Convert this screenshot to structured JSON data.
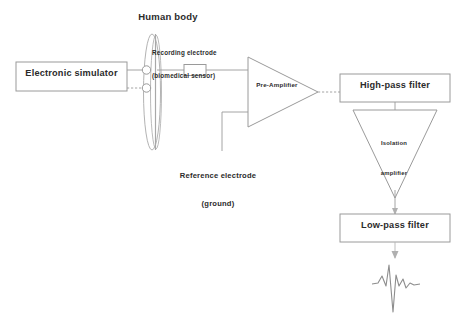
{
  "diagram": {
    "background_color": "#ffffff",
    "line_color": "#8a8a8a",
    "text_color": "#2b2b2b",
    "blocks": [
      {
        "id": "electronic-simulator",
        "label": "Electronic simulator",
        "shape": "rectangle"
      },
      {
        "id": "human-body",
        "label": "Human body",
        "shape": "body-outline"
      },
      {
        "id": "recording-electrode",
        "label": "Recording electrode\n(biomedical sensor)",
        "shape": "resistor"
      },
      {
        "id": "reference-electrode",
        "label": "Reference electrode\n(ground)",
        "shape": "wire"
      },
      {
        "id": "pre-amplifier",
        "label": "Pre-Amplifier",
        "shape": "triangle-right"
      },
      {
        "id": "high-pass-filter",
        "label": "High-pass filter",
        "shape": "rectangle"
      },
      {
        "id": "isolation-amplifier",
        "label": "Isolation\namplifier",
        "shape": "triangle-down"
      },
      {
        "id": "low-pass-filter",
        "label": "Low-pass filter",
        "shape": "rectangle"
      },
      {
        "id": "output-waveform",
        "label": "",
        "shape": "ecg-trace"
      }
    ],
    "labels": {
      "electronic_simulator": "Electronic simulator",
      "human_body": "Human body",
      "recording_electrode_line1": "Recording electrode",
      "recording_electrode_line2": "(biomedical sensor)",
      "reference_electrode_line1": "Reference electrode",
      "reference_electrode_line2": "(ground)",
      "pre_amplifier": "Pre-Amplifier",
      "high_pass_filter": "High-pass filter",
      "isolation_amplifier_line1": "Isolation",
      "isolation_amplifier_line2": "amplifier",
      "low_pass_filter": "Low-pass filter"
    }
  }
}
